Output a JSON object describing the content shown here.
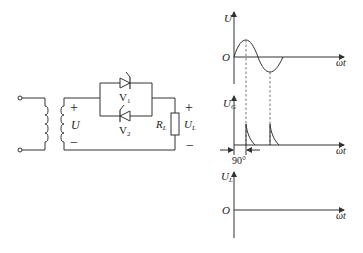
{
  "circuit": {
    "source_voltage_label": "U",
    "plus_sign": "+",
    "minus_sign": "−",
    "thyristor_1_label": "V",
    "thyristor_1_sub": "1",
    "thyristor_2_label": "V",
    "thyristor_2_sub": "2",
    "load_resistor_label": "R",
    "load_resistor_sub": "L",
    "load_voltage_label": "U",
    "load_voltage_sub": "L"
  },
  "graphs": {
    "supply": {
      "y_label": "U",
      "origin": "O",
      "x_label": "ωt"
    },
    "gate": {
      "y_label": "U",
      "y_sub": "G",
      "x_label": "ωt",
      "angle_label": "90°"
    },
    "load": {
      "y_label": "U",
      "y_sub": "L",
      "origin": "O",
      "x_label": "ωt"
    }
  },
  "colors": {
    "line": "#333333",
    "background": "#ffffff"
  }
}
